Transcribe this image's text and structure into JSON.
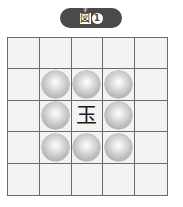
{
  "title": {
    "ruby": "ず",
    "label": "図",
    "number": "1"
  },
  "board": {
    "rows": 5,
    "cols": 5,
    "center_piece": "玉",
    "marked_cells": [
      [
        1,
        1
      ],
      [
        1,
        2
      ],
      [
        1,
        3
      ],
      [
        2,
        1
      ],
      [
        2,
        3
      ],
      [
        3,
        1
      ],
      [
        3,
        2
      ],
      [
        3,
        3
      ]
    ],
    "colors": {
      "grid_line": "#6a6a6a",
      "cell_bg": "#f3f3f3",
      "title_bg": "#4a4a4a"
    }
  }
}
